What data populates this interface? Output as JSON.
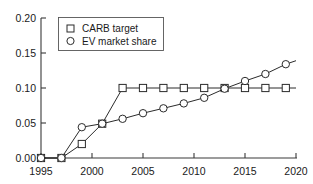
{
  "chart_data": {
    "type": "line",
    "title": "",
    "xlabel": "",
    "ylabel": "",
    "xlim": [
      1995,
      2020
    ],
    "ylim": [
      0.0,
      0.2
    ],
    "grid": false,
    "legend_position": "upper-left",
    "x_ticks": [
      "1995",
      "2000",
      "2005",
      "2010",
      "2015",
      "2020"
    ],
    "x_tick_values": [
      1995,
      2000,
      2005,
      2010,
      2015,
      2020
    ],
    "y_ticks": [
      "0.00",
      "0.05",
      "0.10",
      "0.15",
      "0.20"
    ],
    "y_tick_values": [
      0.0,
      0.05,
      0.1,
      0.15,
      0.2
    ],
    "series": [
      {
        "name": "CARB target",
        "marker": "square",
        "x": [
          1995,
          1997,
          1999,
          2001,
          2003,
          2005,
          2007,
          2009,
          2011,
          2013,
          2015,
          2017,
          2019
        ],
        "values": [
          0.0,
          0.0,
          0.02,
          0.049,
          0.1,
          0.1,
          0.1,
          0.1,
          0.1,
          0.1,
          0.1,
          0.1,
          0.1
        ]
      },
      {
        "name": "EV market share",
        "marker": "circle",
        "x": [
          1995,
          1997,
          1999,
          2001,
          2003,
          2005,
          2007,
          2009,
          2011,
          2013,
          2015,
          2017,
          2019
        ],
        "values": [
          0.0,
          0.0,
          0.044,
          0.049,
          0.056,
          0.064,
          0.071,
          0.078,
          0.086,
          0.099,
          0.11,
          0.12,
          0.134
        ]
      }
    ],
    "line_end_x": 2020,
    "line_end_values": {
      "CARB target": 0.1,
      "EV market share": 0.139
    }
  },
  "legend": {
    "entries": [
      {
        "label": "CARB target",
        "marker": "square-marker"
      },
      {
        "label": "EV market share",
        "marker": "circle-marker"
      }
    ]
  }
}
